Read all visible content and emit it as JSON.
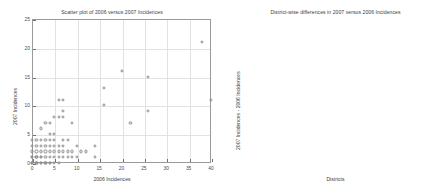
{
  "figure": {
    "width": 447,
    "height": 191,
    "background": "#ffffff",
    "marker_color_left": "#8e8e8e",
    "marker_color_right": "#000000",
    "grid_color": "#e2e2e2",
    "axis_color": "#9a9a9a"
  },
  "chart_data": [
    {
      "type": "scatter",
      "title": "Scatter plot of 2006 versus 2007 Incidences",
      "xlabel": "2006 Incidences",
      "ylabel": "2007 Incidences",
      "xlim": [
        0,
        40
      ],
      "ylim": [
        0,
        25
      ],
      "xticks": [
        0,
        5,
        10,
        15,
        20,
        25,
        30,
        35,
        40
      ],
      "yticks": [
        0,
        5,
        10,
        15,
        20,
        25
      ],
      "grid": true,
      "legend": "none",
      "marker": "o",
      "points": [
        [
          0,
          0
        ],
        [
          0,
          0
        ],
        [
          0,
          0
        ],
        [
          0,
          1
        ],
        [
          0,
          1
        ],
        [
          0,
          2
        ],
        [
          0,
          3
        ],
        [
          0,
          4
        ],
        [
          1,
          0
        ],
        [
          1,
          0
        ],
        [
          1,
          1
        ],
        [
          1,
          1
        ],
        [
          1,
          2
        ],
        [
          1,
          3
        ],
        [
          1,
          4
        ],
        [
          2,
          0
        ],
        [
          2,
          0
        ],
        [
          2,
          1
        ],
        [
          2,
          1
        ],
        [
          2,
          2
        ],
        [
          2,
          3
        ],
        [
          2,
          4
        ],
        [
          2,
          6
        ],
        [
          3,
          0
        ],
        [
          3,
          0
        ],
        [
          3,
          1
        ],
        [
          3,
          2
        ],
        [
          3,
          3
        ],
        [
          3,
          4
        ],
        [
          3,
          7
        ],
        [
          4,
          0
        ],
        [
          4,
          0
        ],
        [
          4,
          1
        ],
        [
          4,
          2
        ],
        [
          4,
          3
        ],
        [
          4,
          4
        ],
        [
          4,
          5
        ],
        [
          4,
          7
        ],
        [
          5,
          0
        ],
        [
          5,
          1
        ],
        [
          5,
          2
        ],
        [
          5,
          3
        ],
        [
          5,
          4
        ],
        [
          5,
          5
        ],
        [
          5,
          8
        ],
        [
          6,
          0
        ],
        [
          6,
          1
        ],
        [
          6,
          2
        ],
        [
          6,
          3
        ],
        [
          6,
          8
        ],
        [
          6,
          11
        ],
        [
          7,
          1
        ],
        [
          7,
          2
        ],
        [
          7,
          3
        ],
        [
          7,
          4
        ],
        [
          7,
          8
        ],
        [
          7,
          9
        ],
        [
          7,
          11
        ],
        [
          8,
          1
        ],
        [
          8,
          2
        ],
        [
          8,
          4
        ],
        [
          9,
          1
        ],
        [
          9,
          2
        ],
        [
          9,
          7
        ],
        [
          10,
          1
        ],
        [
          10,
          3
        ],
        [
          11,
          2
        ],
        [
          12,
          2
        ],
        [
          14,
          1
        ],
        [
          14,
          3
        ],
        [
          16,
          10
        ],
        [
          16,
          13
        ],
        [
          20,
          16
        ],
        [
          22,
          7
        ],
        [
          26,
          9
        ],
        [
          26,
          15
        ],
        [
          38,
          21
        ],
        [
          40,
          11
        ]
      ]
    },
    {
      "type": "scatter",
      "title": "District-wise differences in 2007 versus 2006 Incidences",
      "xlabel": "Districts",
      "ylabel": "2007 Incidences - 2006 Incidences",
      "xlim": [
        0,
        350
      ],
      "ylim": [
        -30,
        5
      ],
      "xticks": [
        0,
        50,
        100,
        150,
        200,
        250,
        300,
        350
      ],
      "yticks": [
        5,
        0,
        -5,
        -10,
        -15,
        -20,
        -25,
        -30
      ],
      "grid": true,
      "legend": "none",
      "marker": "+",
      "points": [
        [
          3,
          0
        ],
        [
          6,
          0
        ],
        [
          9,
          0
        ],
        [
          12,
          -1
        ],
        [
          14,
          0
        ],
        [
          16,
          0
        ],
        [
          18,
          -2
        ],
        [
          20,
          0
        ],
        [
          22,
          0
        ],
        [
          24,
          -1
        ],
        [
          26,
          0
        ],
        [
          28,
          -2
        ],
        [
          30,
          0
        ],
        [
          32,
          0
        ],
        [
          34,
          -1
        ],
        [
          36,
          0
        ],
        [
          38,
          3
        ],
        [
          40,
          0
        ],
        [
          41,
          4
        ],
        [
          43,
          0
        ],
        [
          45,
          -2
        ],
        [
          47,
          0
        ],
        [
          49,
          0
        ],
        [
          51,
          -1
        ],
        [
          53,
          0
        ],
        [
          55,
          0
        ],
        [
          57,
          1
        ],
        [
          59,
          0
        ],
        [
          61,
          0
        ],
        [
          63,
          -1
        ],
        [
          65,
          0
        ],
        [
          67,
          -3
        ],
        [
          69,
          0
        ],
        [
          71,
          0
        ],
        [
          73,
          2
        ],
        [
          75,
          0
        ],
        [
          77,
          2
        ],
        [
          79,
          0
        ],
        [
          81,
          -1
        ],
        [
          83,
          0
        ],
        [
          85,
          0
        ],
        [
          87,
          -1
        ],
        [
          89,
          0
        ],
        [
          91,
          0
        ],
        [
          93,
          -1
        ],
        [
          95,
          0
        ],
        [
          97,
          0
        ],
        [
          99,
          -2
        ],
        [
          101,
          0
        ],
        [
          103,
          0
        ],
        [
          105,
          1
        ],
        [
          107,
          0
        ],
        [
          109,
          1
        ],
        [
          111,
          0
        ],
        [
          113,
          0
        ],
        [
          115,
          -1
        ],
        [
          117,
          0
        ],
        [
          119,
          1
        ],
        [
          121,
          0
        ],
        [
          123,
          0
        ],
        [
          125,
          -1
        ],
        [
          127,
          0
        ],
        [
          129,
          0
        ],
        [
          131,
          -1
        ],
        [
          133,
          3
        ],
        [
          135,
          0
        ],
        [
          136,
          3
        ],
        [
          138,
          0
        ],
        [
          140,
          -1
        ],
        [
          142,
          0
        ],
        [
          144,
          0
        ],
        [
          146,
          -1
        ],
        [
          148,
          0
        ],
        [
          150,
          0
        ],
        [
          152,
          -1
        ],
        [
          154,
          0
        ],
        [
          156,
          0
        ],
        [
          158,
          -2
        ],
        [
          160,
          0
        ],
        [
          162,
          0
        ],
        [
          164,
          -1
        ],
        [
          166,
          0
        ],
        [
          168,
          -29
        ],
        [
          170,
          0
        ],
        [
          171,
          -13
        ],
        [
          173,
          0
        ],
        [
          175,
          0
        ],
        [
          177,
          -1
        ],
        [
          179,
          0
        ],
        [
          181,
          0
        ],
        [
          183,
          -2
        ],
        [
          185,
          0
        ],
        [
          187,
          0
        ],
        [
          189,
          -15
        ],
        [
          191,
          0
        ],
        [
          193,
          3
        ],
        [
          195,
          0
        ],
        [
          197,
          0
        ],
        [
          199,
          -1
        ],
        [
          201,
          0
        ],
        [
          203,
          0
        ],
        [
          205,
          -1
        ],
        [
          207,
          0
        ],
        [
          209,
          0
        ],
        [
          211,
          -2
        ],
        [
          213,
          0
        ],
        [
          215,
          0
        ],
        [
          217,
          -1
        ],
        [
          219,
          0
        ],
        [
          221,
          0
        ],
        [
          223,
          -2
        ],
        [
          225,
          0
        ],
        [
          227,
          0
        ],
        [
          229,
          -4
        ],
        [
          231,
          0
        ],
        [
          233,
          -11
        ],
        [
          235,
          2
        ],
        [
          237,
          0
        ],
        [
          239,
          4
        ],
        [
          240,
          3
        ],
        [
          241,
          0
        ],
        [
          243,
          4
        ],
        [
          244,
          2
        ],
        [
          245,
          0
        ],
        [
          246,
          -5
        ],
        [
          247,
          4
        ],
        [
          248,
          0
        ],
        [
          249,
          -5
        ],
        [
          250,
          3
        ],
        [
          251,
          0
        ],
        [
          252,
          -17
        ],
        [
          253,
          0
        ],
        [
          254,
          -5
        ],
        [
          255,
          2
        ],
        [
          256,
          0
        ],
        [
          257,
          -5
        ],
        [
          259,
          0
        ],
        [
          261,
          0
        ],
        [
          263,
          2
        ],
        [
          265,
          0
        ],
        [
          267,
          0
        ],
        [
          269,
          -1
        ],
        [
          271,
          0
        ],
        [
          273,
          -10
        ],
        [
          275,
          0
        ],
        [
          277,
          -3
        ],
        [
          279,
          0
        ],
        [
          281,
          4
        ],
        [
          283,
          0
        ],
        [
          285,
          -3
        ],
        [
          287,
          0
        ],
        [
          289,
          0
        ],
        [
          291,
          -17
        ],
        [
          293,
          0
        ],
        [
          295,
          -3
        ],
        [
          297,
          0
        ],
        [
          299,
          3
        ],
        [
          301,
          0
        ],
        [
          303,
          -2
        ],
        [
          305,
          0
        ],
        [
          307,
          -1
        ],
        [
          309,
          0
        ],
        [
          311,
          -4
        ],
        [
          313,
          0
        ],
        [
          315,
          -6
        ],
        [
          317,
          -7
        ],
        [
          319,
          -7
        ],
        [
          321,
          0
        ],
        [
          323,
          -11
        ],
        [
          325,
          0
        ],
        [
          327,
          0
        ],
        [
          329,
          -1
        ],
        [
          331,
          0
        ]
      ]
    }
  ]
}
